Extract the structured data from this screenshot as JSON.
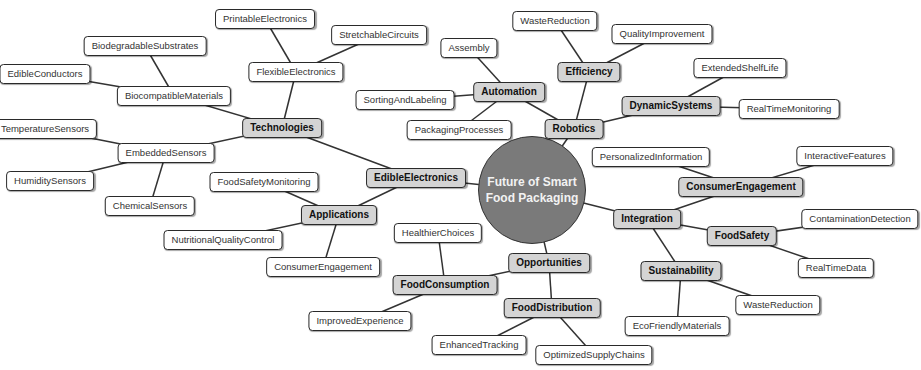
{
  "diagram": {
    "type": "mindmap",
    "root": {
      "id": "root",
      "label": "Future of Smart Food Packaging",
      "x": 532,
      "y": 190
    },
    "nodes": [
      {
        "id": "edible",
        "label": "EdibleElectronics",
        "x": 416,
        "y": 178,
        "level": 1
      },
      {
        "id": "robotics",
        "label": "Robotics",
        "x": 574,
        "y": 129,
        "level": 1
      },
      {
        "id": "integration",
        "label": "Integration",
        "x": 647,
        "y": 219,
        "level": 1
      },
      {
        "id": "opportunities",
        "label": "Opportunities",
        "x": 549,
        "y": 263,
        "level": 1
      },
      {
        "id": "technologies",
        "label": "Technologies",
        "x": 282,
        "y": 128,
        "level": 2
      },
      {
        "id": "applications",
        "label": "Applications",
        "x": 339,
        "y": 215,
        "level": 2
      },
      {
        "id": "automation",
        "label": "Automation",
        "x": 509,
        "y": 92,
        "level": 2
      },
      {
        "id": "efficiency",
        "label": "Efficiency",
        "x": 589,
        "y": 72,
        "level": 2
      },
      {
        "id": "dynamic",
        "label": "DynamicSystems",
        "x": 671,
        "y": 106,
        "level": 2
      },
      {
        "id": "consumerEng",
        "label": "ConsumerEngagement",
        "x": 741,
        "y": 187,
        "level": 2
      },
      {
        "id": "foodSafety",
        "label": "FoodSafety",
        "x": 742,
        "y": 236,
        "level": 2
      },
      {
        "id": "sustainability",
        "label": "Sustainability",
        "x": 681,
        "y": 271,
        "level": 2
      },
      {
        "id": "foodConsumption",
        "label": "FoodConsumption",
        "x": 445,
        "y": 285,
        "level": 2
      },
      {
        "id": "foodDistribution",
        "label": "FoodDistribution",
        "x": 552,
        "y": 308,
        "level": 2
      },
      {
        "id": "flexible",
        "label": "FlexibleElectronics",
        "x": 296,
        "y": 72,
        "level": 3
      },
      {
        "id": "printable",
        "label": "PrintableElectronics",
        "x": 265,
        "y": 19,
        "level": 3
      },
      {
        "id": "stretchable",
        "label": "StretchableCircuits",
        "x": 379,
        "y": 35,
        "level": 3
      },
      {
        "id": "biocompatible",
        "label": "BiocompatibleMaterials",
        "x": 174,
        "y": 96,
        "level": 3
      },
      {
        "id": "biodegradable",
        "label": "BiodegradableSubstrates",
        "x": 145,
        "y": 46,
        "level": 3
      },
      {
        "id": "edibleConductors",
        "label": "EdibleConductors",
        "x": 45,
        "y": 74,
        "level": 3
      },
      {
        "id": "embedded",
        "label": "EmbeddedSensors",
        "x": 166,
        "y": 153,
        "level": 3
      },
      {
        "id": "temperature",
        "label": "TemperatureSensors",
        "x": 45,
        "y": 129,
        "level": 3
      },
      {
        "id": "humidity",
        "label": "HumiditySensors",
        "x": 50,
        "y": 181,
        "level": 3
      },
      {
        "id": "chemical",
        "label": "ChemicalSensors",
        "x": 150,
        "y": 206,
        "level": 3
      },
      {
        "id": "foodSafetyMon",
        "label": "FoodSafetyMonitoring",
        "x": 264,
        "y": 182,
        "level": 3
      },
      {
        "id": "nutritional",
        "label": "NutritionalQualityControl",
        "x": 223,
        "y": 240,
        "level": 3
      },
      {
        "id": "consumerEngApp",
        "label": "ConsumerEngagement",
        "x": 323,
        "y": 267,
        "level": 3
      },
      {
        "id": "assembly",
        "label": "Assembly",
        "x": 469,
        "y": 48,
        "level": 3
      },
      {
        "id": "sorting",
        "label": "SortingAndLabeling",
        "x": 405,
        "y": 100,
        "level": 3
      },
      {
        "id": "packaging",
        "label": "PackagingProcesses",
        "x": 459,
        "y": 130,
        "level": 3
      },
      {
        "id": "wasteRed1",
        "label": "WasteReduction",
        "x": 555,
        "y": 21,
        "level": 3
      },
      {
        "id": "quality",
        "label": "QualityImprovement",
        "x": 662,
        "y": 34,
        "level": 3
      },
      {
        "id": "shelfLife",
        "label": "ExtendedShelfLife",
        "x": 740,
        "y": 68,
        "level": 3
      },
      {
        "id": "realTimeMon",
        "label": "RealTimeMonitoring",
        "x": 789,
        "y": 109,
        "level": 3
      },
      {
        "id": "personalized",
        "label": "PersonalizedInformation",
        "x": 651,
        "y": 157,
        "level": 3
      },
      {
        "id": "interactive",
        "label": "InteractiveFeatures",
        "x": 845,
        "y": 156,
        "level": 3
      },
      {
        "id": "contamination",
        "label": "ContaminationDetection",
        "x": 860,
        "y": 219,
        "level": 3
      },
      {
        "id": "realTimeData",
        "label": "RealTimeData",
        "x": 836,
        "y": 268,
        "level": 3
      },
      {
        "id": "wasteRed2",
        "label": "WasteReduction",
        "x": 778,
        "y": 305,
        "level": 3
      },
      {
        "id": "ecoFriendly",
        "label": "EcoFriendlyMaterials",
        "x": 677,
        "y": 326,
        "level": 3
      },
      {
        "id": "healthier",
        "label": "HealthierChoices",
        "x": 438,
        "y": 233,
        "level": 3
      },
      {
        "id": "improvedExp",
        "label": "ImprovedExperience",
        "x": 360,
        "y": 321,
        "level": 3
      },
      {
        "id": "enhancedTrack",
        "label": "EnhancedTracking",
        "x": 479,
        "y": 345,
        "level": 3
      },
      {
        "id": "optimizedSupply",
        "label": "OptimizedSupplyChains",
        "x": 594,
        "y": 355,
        "level": 3
      }
    ],
    "edges": [
      [
        "root",
        "edible"
      ],
      [
        "root",
        "robotics"
      ],
      [
        "root",
        "integration"
      ],
      [
        "root",
        "opportunities"
      ],
      [
        "edible",
        "technologies"
      ],
      [
        "edible",
        "applications"
      ],
      [
        "technologies",
        "flexible"
      ],
      [
        "technologies",
        "biocompatible"
      ],
      [
        "technologies",
        "embedded"
      ],
      [
        "flexible",
        "printable"
      ],
      [
        "flexible",
        "stretchable"
      ],
      [
        "biocompatible",
        "biodegradable"
      ],
      [
        "biocompatible",
        "edibleConductors"
      ],
      [
        "embedded",
        "temperature"
      ],
      [
        "embedded",
        "humidity"
      ],
      [
        "embedded",
        "chemical"
      ],
      [
        "applications",
        "foodSafetyMon"
      ],
      [
        "applications",
        "nutritional"
      ],
      [
        "applications",
        "consumerEngApp"
      ],
      [
        "robotics",
        "automation"
      ],
      [
        "robotics",
        "efficiency"
      ],
      [
        "robotics",
        "dynamic"
      ],
      [
        "automation",
        "assembly"
      ],
      [
        "automation",
        "sorting"
      ],
      [
        "automation",
        "packaging"
      ],
      [
        "efficiency",
        "wasteRed1"
      ],
      [
        "efficiency",
        "quality"
      ],
      [
        "dynamic",
        "shelfLife"
      ],
      [
        "dynamic",
        "realTimeMon"
      ],
      [
        "integration",
        "consumerEng"
      ],
      [
        "integration",
        "foodSafety"
      ],
      [
        "integration",
        "sustainability"
      ],
      [
        "consumerEng",
        "personalized"
      ],
      [
        "consumerEng",
        "interactive"
      ],
      [
        "foodSafety",
        "contamination"
      ],
      [
        "foodSafety",
        "realTimeData"
      ],
      [
        "sustainability",
        "wasteRed2"
      ],
      [
        "sustainability",
        "ecoFriendly"
      ],
      [
        "opportunities",
        "foodConsumption"
      ],
      [
        "opportunities",
        "foodDistribution"
      ],
      [
        "foodConsumption",
        "healthier"
      ],
      [
        "foodConsumption",
        "improvedExp"
      ],
      [
        "foodDistribution",
        "enhancedTrack"
      ],
      [
        "foodDistribution",
        "optimizedSupply"
      ]
    ],
    "colors": {
      "root_fill": "#7a7a7a",
      "subtopic_fill": "#d4d4d4",
      "leaf_fill": "#ffffff",
      "edge": "#333333",
      "text_root": "#f2f2f2"
    }
  }
}
